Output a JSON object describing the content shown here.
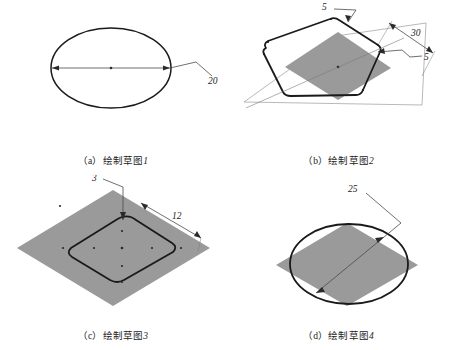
{
  "sheet": {
    "title": "Sketch construction steps",
    "background_color": "#ffffff",
    "outline_color": "#1a1a1a",
    "fill_gray": "#9a9a9a",
    "thin_line_color": "#6b6b6b"
  },
  "panels": [
    {
      "id": "a",
      "caption_index": "（a）绘制草图",
      "caption_number": "1",
      "caption_full": "（a）绘制草图1",
      "shape": "ellipse",
      "shape_name": "ellipse-sketch",
      "has_gray_fill": false,
      "dimensions": [
        {
          "label": "20",
          "name": "diameter-dimension-20",
          "kind": "diameter"
        }
      ]
    },
    {
      "id": "b",
      "caption_index": "（b）绘制草图",
      "caption_number": "2",
      "caption_full": "（b）绘制草图2",
      "shape": "rounded-hexagon",
      "shape_name": "hexagon-sketch",
      "has_gray_fill": true,
      "gray_fill_shape": "diamond",
      "dimensions": [
        {
          "label": "5",
          "name": "fillet-radius-dimension-5-top",
          "kind": "radius"
        },
        {
          "label": "30",
          "name": "width-dimension-30",
          "kind": "linear"
        },
        {
          "label": "5",
          "name": "fillet-radius-dimension-5-right",
          "kind": "radius"
        }
      ]
    },
    {
      "id": "c",
      "caption_index": "（c）绘制草图",
      "caption_number": "3",
      "caption_full": "（c）绘制草图3",
      "shape": "rounded-square",
      "shape_name": "rounded-square-sketch",
      "has_gray_fill": true,
      "gray_fill_shape": "diamond",
      "dimensions": [
        {
          "label": "3",
          "name": "fillet-radius-dimension-3",
          "kind": "radius"
        },
        {
          "label": "12",
          "name": "width-dimension-12",
          "kind": "linear"
        }
      ]
    },
    {
      "id": "d",
      "caption_index": "（d）绘制草图",
      "caption_number": "4",
      "caption_full": "（d）绘制草图4",
      "shape": "circle",
      "shape_name": "circle-sketch",
      "has_gray_fill": true,
      "gray_fill_shape": "diamond",
      "dimensions": [
        {
          "label": "25",
          "name": "diameter-dimension-25",
          "kind": "diameter"
        }
      ]
    }
  ]
}
